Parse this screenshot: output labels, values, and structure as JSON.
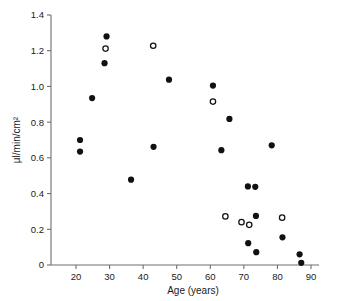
{
  "chart_data": {
    "type": "scatter",
    "title": "",
    "xlabel": "Age (years)",
    "ylabel": "μl/min/cm²",
    "xlim": [
      18,
      91
    ],
    "ylim": [
      0,
      1.4
    ],
    "xticks": [
      20,
      30,
      40,
      50,
      60,
      70,
      80,
      90
    ],
    "xticklabels": [
      "20",
      "30",
      "40",
      "50",
      "60",
      "70",
      "80",
      "90"
    ],
    "yticks": [
      0,
      0.2,
      0.4,
      0.6,
      0.8,
      1.0,
      1.2,
      1.4
    ],
    "yticklabels": [
      "0",
      "0.2",
      "0.4",
      "0.6",
      "0.8",
      "1.0",
      "1.2",
      "1.4"
    ],
    "grid": false,
    "legend": null,
    "series": [
      {
        "name": "filled",
        "marker": "filled-circle",
        "color": "#111111",
        "points": [
          [
            21.2,
            0.7
          ],
          [
            21.2,
            0.635
          ],
          [
            24.8,
            0.935
          ],
          [
            28.5,
            1.13
          ],
          [
            29.1,
            1.28
          ],
          [
            36.4,
            0.478
          ],
          [
            43.1,
            0.662
          ],
          [
            47.7,
            1.038
          ],
          [
            60.8,
            1.005
          ],
          [
            63.3,
            0.643
          ],
          [
            65.7,
            0.818
          ],
          [
            71.2,
            0.44
          ],
          [
            71.3,
            0.122
          ],
          [
            73.4,
            0.438
          ],
          [
            73.6,
            0.275
          ],
          [
            73.7,
            0.072
          ],
          [
            78.3,
            0.67
          ],
          [
            81.5,
            0.155
          ],
          [
            86.6,
            0.06
          ],
          [
            87.1,
            0.012
          ]
        ]
      },
      {
        "name": "open",
        "marker": "open-circle",
        "color": "#111111",
        "points": [
          [
            28.8,
            1.212
          ],
          [
            43.0,
            1.228
          ],
          [
            60.8,
            0.915
          ],
          [
            64.5,
            0.272
          ],
          [
            69.3,
            0.24
          ],
          [
            71.6,
            0.225
          ],
          [
            81.4,
            0.265
          ]
        ]
      }
    ]
  },
  "axes": {
    "x_axis_label": "Age (years)",
    "y_axis_label": "μl/min/cm²"
  }
}
